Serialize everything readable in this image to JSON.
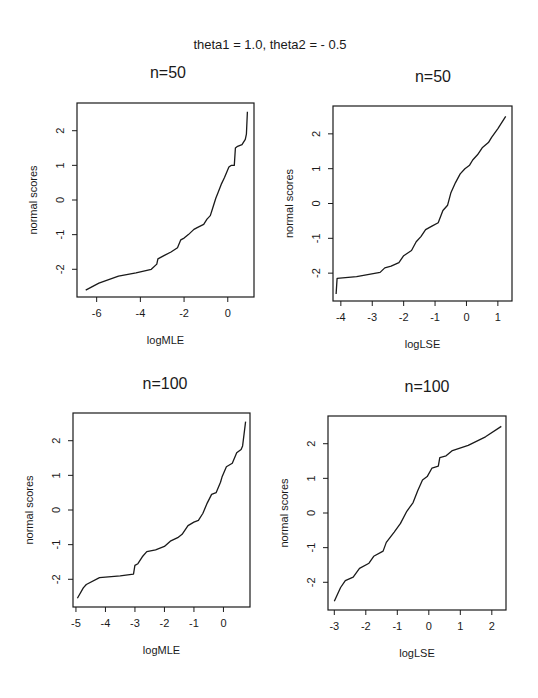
{
  "figure": {
    "suptitle": "theta1 = 1.0, theta2 = - 0.5",
    "line_color": "#1a1a1a",
    "background": "#ffffff"
  },
  "chart_data": [
    {
      "type": "line",
      "title": "n=50",
      "xlabel": "logMLE",
      "ylabel": "normal scores",
      "xticks": [
        -6,
        -4,
        -2,
        0
      ],
      "yticks": [
        -2,
        -1,
        0,
        1,
        2
      ],
      "xlim": [
        -6.9,
        1.2
      ],
      "ylim": [
        -2.8,
        2.8
      ],
      "grid": false,
      "legend": null,
      "series": [
        {
          "name": "Q-Q plot logMLE n=50",
          "x": [
            -6.5,
            -5.9,
            -5.0,
            -4.2,
            -3.5,
            -3.25,
            -3.2,
            -2.9,
            -2.6,
            -2.3,
            -2.15,
            -2.0,
            -1.8,
            -1.55,
            -1.4,
            -1.1,
            -0.95,
            -0.8,
            -0.7,
            -0.55,
            -0.45,
            -0.3,
            -0.15,
            -0.05,
            0.05,
            0.15,
            0.3,
            0.35,
            0.45,
            0.65,
            0.8,
            0.85,
            0.9
          ],
          "y": [
            -2.6,
            -2.4,
            -2.2,
            -2.1,
            -2.0,
            -1.85,
            -1.7,
            -1.6,
            -1.5,
            -1.38,
            -1.15,
            -1.1,
            -1.0,
            -0.85,
            -0.8,
            -0.7,
            -0.55,
            -0.45,
            -0.25,
            0.05,
            0.2,
            0.45,
            0.65,
            0.8,
            0.95,
            1.0,
            1.0,
            1.5,
            1.55,
            1.6,
            1.75,
            1.9,
            2.55
          ]
        }
      ]
    },
    {
      "type": "line",
      "title": "n=50",
      "xlabel": "logLSE",
      "ylabel": "normal scores",
      "xticks": [
        -4,
        -3,
        -2,
        -1,
        0,
        1
      ],
      "yticks": [
        -2,
        -1,
        0,
        1,
        2
      ],
      "xlim": [
        -4.25,
        1.45
      ],
      "ylim": [
        -2.8,
        2.8
      ],
      "grid": false,
      "legend": null,
      "series": [
        {
          "name": "Q-Q plot logLSE n=50",
          "x": [
            -4.15,
            -4.12,
            -3.5,
            -2.75,
            -2.6,
            -2.4,
            -2.15,
            -2.0,
            -1.75,
            -1.6,
            -1.45,
            -1.3,
            -1.1,
            -0.9,
            -0.75,
            -0.6,
            -0.5,
            -0.35,
            -0.2,
            -0.05,
            0.1,
            0.2,
            0.35,
            0.5,
            0.7,
            0.8,
            1.0,
            1.25
          ],
          "y": [
            -2.6,
            -2.15,
            -2.1,
            -1.98,
            -1.85,
            -1.8,
            -1.7,
            -1.5,
            -1.35,
            -1.1,
            -0.95,
            -0.75,
            -0.65,
            -0.55,
            -0.2,
            -0.05,
            0.3,
            0.6,
            0.85,
            1.0,
            1.1,
            1.25,
            1.4,
            1.6,
            1.75,
            1.9,
            2.15,
            2.5
          ]
        }
      ]
    },
    {
      "type": "line",
      "title": "n=100",
      "xlabel": "logMLE",
      "ylabel": "normal scores",
      "xticks": [
        -5,
        -4,
        -3,
        -2,
        -1,
        0
      ],
      "yticks": [
        -2,
        -1,
        0,
        1,
        2
      ],
      "xlim": [
        -5.1,
        0.9
      ],
      "ylim": [
        -2.8,
        2.8
      ],
      "grid": false,
      "legend": null,
      "series": [
        {
          "name": "Q-Q plot logMLE n=100",
          "x": [
            -4.95,
            -4.75,
            -4.65,
            -4.2,
            -3.5,
            -3.05,
            -3.0,
            -2.9,
            -2.75,
            -2.6,
            -2.3,
            -2.0,
            -1.8,
            -1.55,
            -1.4,
            -1.2,
            -1.0,
            -0.85,
            -0.7,
            -0.55,
            -0.4,
            -0.25,
            -0.1,
            -0.05,
            0.1,
            0.3,
            0.45,
            0.6,
            0.65,
            0.75
          ],
          "y": [
            -2.55,
            -2.25,
            -2.15,
            -1.95,
            -1.9,
            -1.85,
            -1.6,
            -1.55,
            -1.35,
            -1.2,
            -1.15,
            -1.05,
            -0.9,
            -0.8,
            -0.7,
            -0.45,
            -0.35,
            -0.3,
            -0.1,
            0.2,
            0.45,
            0.5,
            0.8,
            0.95,
            1.25,
            1.35,
            1.65,
            1.75,
            1.85,
            2.55
          ]
        }
      ]
    },
    {
      "type": "line",
      "title": "n=100",
      "xlabel": "logLSE",
      "ylabel": "normal scores",
      "xticks": [
        -3,
        -2,
        -1,
        0,
        1,
        2
      ],
      "yticks": [
        -2,
        -1,
        0,
        1,
        2
      ],
      "xlim": [
        -3.2,
        2.45
      ],
      "ylim": [
        -2.8,
        2.8
      ],
      "grid": false,
      "legend": null,
      "series": [
        {
          "name": "Q-Q plot logLSE n=100",
          "x": [
            -3.0,
            -2.8,
            -2.65,
            -2.4,
            -2.2,
            -1.9,
            -1.75,
            -1.45,
            -1.35,
            -1.1,
            -0.9,
            -0.7,
            -0.5,
            -0.35,
            -0.2,
            -0.05,
            0.1,
            0.3,
            0.35,
            0.55,
            0.75,
            1.25,
            1.8,
            2.3
          ],
          "y": [
            -2.55,
            -2.15,
            -1.95,
            -1.85,
            -1.6,
            -1.45,
            -1.25,
            -1.1,
            -0.85,
            -0.55,
            -0.3,
            0.05,
            0.3,
            0.65,
            0.95,
            1.05,
            1.3,
            1.35,
            1.6,
            1.65,
            1.8,
            1.95,
            2.2,
            2.5
          ]
        }
      ]
    }
  ],
  "panels_layout": [
    {
      "box": [
        77,
        103,
        254,
        297
      ],
      "title_pos": [
        168,
        78
      ]
    },
    {
      "box": [
        333,
        106,
        512,
        301
      ],
      "title_pos": [
        433,
        82
      ]
    },
    {
      "box": [
        73,
        413,
        250,
        607
      ],
      "title_pos": [
        165,
        389
      ]
    },
    {
      "box": [
        328,
        416,
        506,
        610
      ],
      "title_pos": [
        427,
        392
      ]
    }
  ]
}
